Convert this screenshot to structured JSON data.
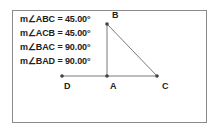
{
  "measurements": [
    {
      "label": "m∠ABC = 45.00°"
    },
    {
      "label": "m∠ACB = 45.00°"
    },
    {
      "label": "m∠BAC = 90.00°"
    },
    {
      "label": "m∠BAD = 90.00°"
    }
  ],
  "points": {
    "A": {
      "label": "A",
      "x": 107,
      "y": 76
    },
    "B": {
      "label": "B",
      "x": 107,
      "y": 24
    },
    "C": {
      "label": "C",
      "x": 157,
      "y": 76
    },
    "D": {
      "label": "D",
      "x": 62,
      "y": 76
    }
  },
  "colors": {
    "segment": "#7a7a7a",
    "point": "#444444",
    "frame": "#8a8a8a"
  }
}
